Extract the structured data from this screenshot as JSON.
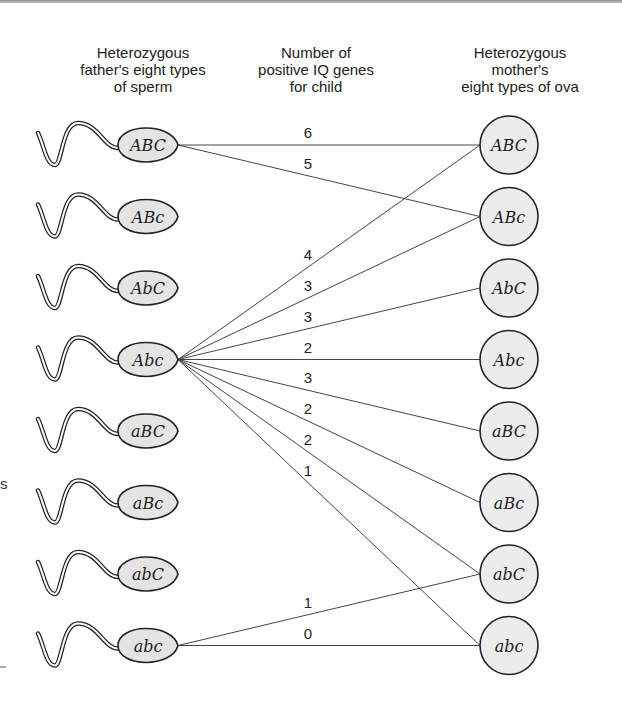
{
  "headers": {
    "father": [
      "Heterozygous",
      "father's eight types",
      "of sperm"
    ],
    "genes": [
      "Number of",
      "positive IQ genes",
      "for child"
    ],
    "mother": [
      "Heterozygous",
      "mother's",
      "eight types of ova"
    ]
  },
  "sperm": [
    "ABC",
    "ABc",
    "AbC",
    "Abc",
    "aBC",
    "aBc",
    "abC",
    "abc"
  ],
  "ova": [
    "ABC",
    "ABc",
    "AbC",
    "Abc",
    "aBC",
    "aBc",
    "abC",
    "abc"
  ],
  "connections": [
    {
      "from": "ABC",
      "to": "ABC",
      "genes": "6"
    },
    {
      "from": "ABC",
      "to": "ABc",
      "genes": "5"
    },
    {
      "from": "Abc",
      "to": "ABC",
      "genes": "4"
    },
    {
      "from": "Abc",
      "to": "ABc",
      "genes": "3"
    },
    {
      "from": "Abc",
      "to": "AbC",
      "genes": "3"
    },
    {
      "from": "Abc",
      "to": "Abc",
      "genes": "2"
    },
    {
      "from": "Abc",
      "to": "aBC",
      "genes": "3"
    },
    {
      "from": "Abc",
      "to": "aBc",
      "genes": "2"
    },
    {
      "from": "Abc",
      "to": "abC",
      "genes": "2"
    },
    {
      "from": "Abc",
      "to": "abc",
      "genes": "1"
    },
    {
      "from": "abc",
      "to": "abC",
      "genes": "1"
    },
    {
      "from": "abc",
      "to": "abc",
      "genes": "0"
    }
  ],
  "edge_fragments": {
    "s": "s"
  }
}
